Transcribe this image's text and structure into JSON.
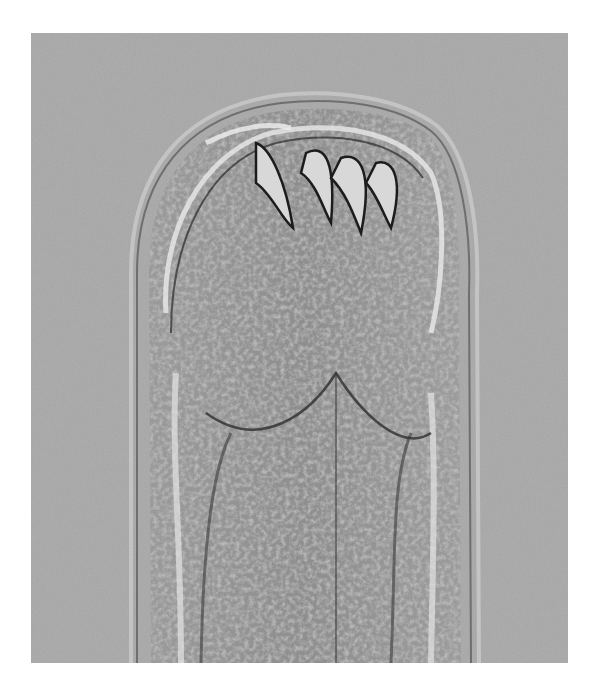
{
  "image": {
    "description": "Brightfield micrograph of the anterior end of a hookworm showing buccal capsule with curved teeth",
    "background_color": "#a8a8a8",
    "frame_color": "#ffffff"
  }
}
